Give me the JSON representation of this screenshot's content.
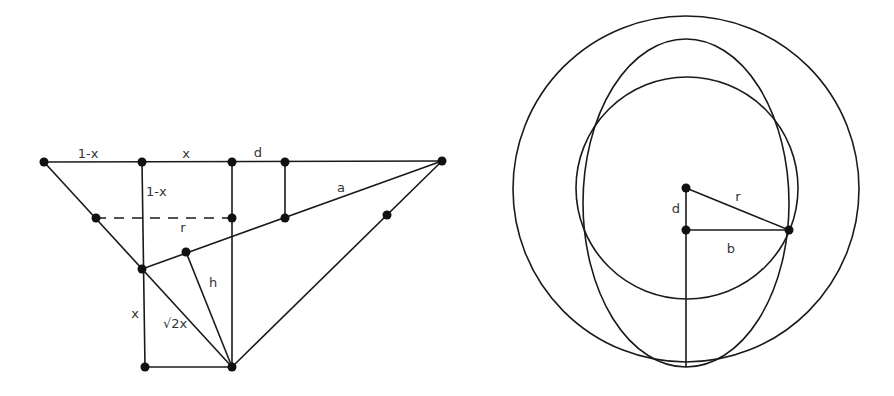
{
  "left_diagram": {
    "labels": {
      "one_minus_x_top": "1-x",
      "x_top": "x",
      "d": "d",
      "one_minus_x_vertical": "1-x",
      "r": "r",
      "a": "a",
      "h": "h",
      "x_vertical": "x",
      "sqrt2x": "√2x"
    },
    "points": [
      {
        "id": "P1",
        "x": 44,
        "y": 162
      },
      {
        "id": "P2",
        "x": 142,
        "y": 162
      },
      {
        "id": "P3",
        "x": 232,
        "y": 162
      },
      {
        "id": "P4",
        "x": 285,
        "y": 162
      },
      {
        "id": "P5",
        "x": 442,
        "y": 161
      },
      {
        "id": "P6",
        "x": 96,
        "y": 218
      },
      {
        "id": "P7",
        "x": 232,
        "y": 218
      },
      {
        "id": "P8",
        "x": 285,
        "y": 218
      },
      {
        "id": "P9",
        "x": 387,
        "y": 215
      },
      {
        "id": "P10",
        "x": 142,
        "y": 269
      },
      {
        "id": "P11",
        "x": 186,
        "y": 252
      },
      {
        "id": "P12",
        "x": 145,
        "y": 367
      },
      {
        "id": "P13",
        "x": 232,
        "y": 367
      }
    ]
  },
  "right_diagram": {
    "labels": {
      "d": "d",
      "r": "r",
      "b": "b"
    },
    "outer_circle": {
      "cx": 686,
      "cy": 189,
      "r": 173
    },
    "ellipse": {
      "cx": 686,
      "cy": 203,
      "rx": 103,
      "ry": 164
    },
    "inner_circle": {
      "cx": 687,
      "cy": 188,
      "r": 111
    },
    "points": [
      {
        "id": "C",
        "x": 686,
        "y": 188
      },
      {
        "id": "D",
        "x": 686,
        "y": 230
      },
      {
        "id": "B",
        "x": 789,
        "y": 230
      }
    ]
  }
}
